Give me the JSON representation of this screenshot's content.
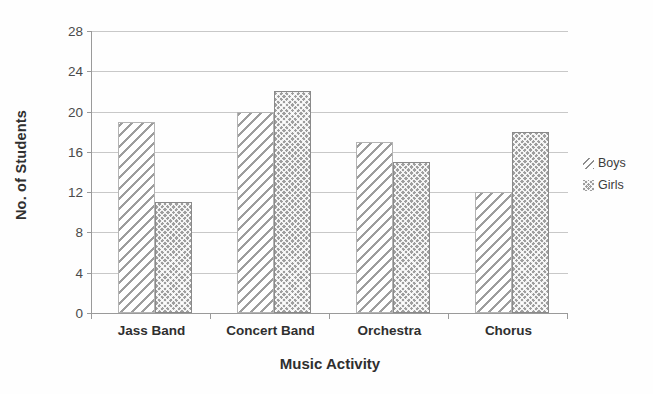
{
  "chart_data": {
    "type": "bar",
    "title": "",
    "subtitle": "",
    "xlabel": "Music Activity",
    "ylabel": "No. of Students",
    "categories": [
      "Jass Band",
      "Concert Band",
      "Orchestra",
      "Chorus"
    ],
    "series": [
      {
        "name": "Boys",
        "values": [
          19,
          20,
          17,
          12
        ],
        "pattern": "diagonal-hatch",
        "color": "#9d9d9d"
      },
      {
        "name": "Girls",
        "values": [
          11,
          22,
          15,
          18
        ],
        "pattern": "dotted-crosshatch",
        "color": "#9e9e9e"
      }
    ],
    "ylim": [
      0,
      28
    ],
    "ytick_step": 4,
    "yticks": [
      0,
      4,
      8,
      12,
      16,
      20,
      24,
      28
    ],
    "ytick_labels": [
      "0",
      "4",
      "8",
      "12",
      "16",
      "20",
      "24",
      "28"
    ],
    "grid": true,
    "grid_axis": "y",
    "legend_position": "right",
    "legend_entries": [
      "Boys",
      "Girls"
    ],
    "annotations": []
  }
}
